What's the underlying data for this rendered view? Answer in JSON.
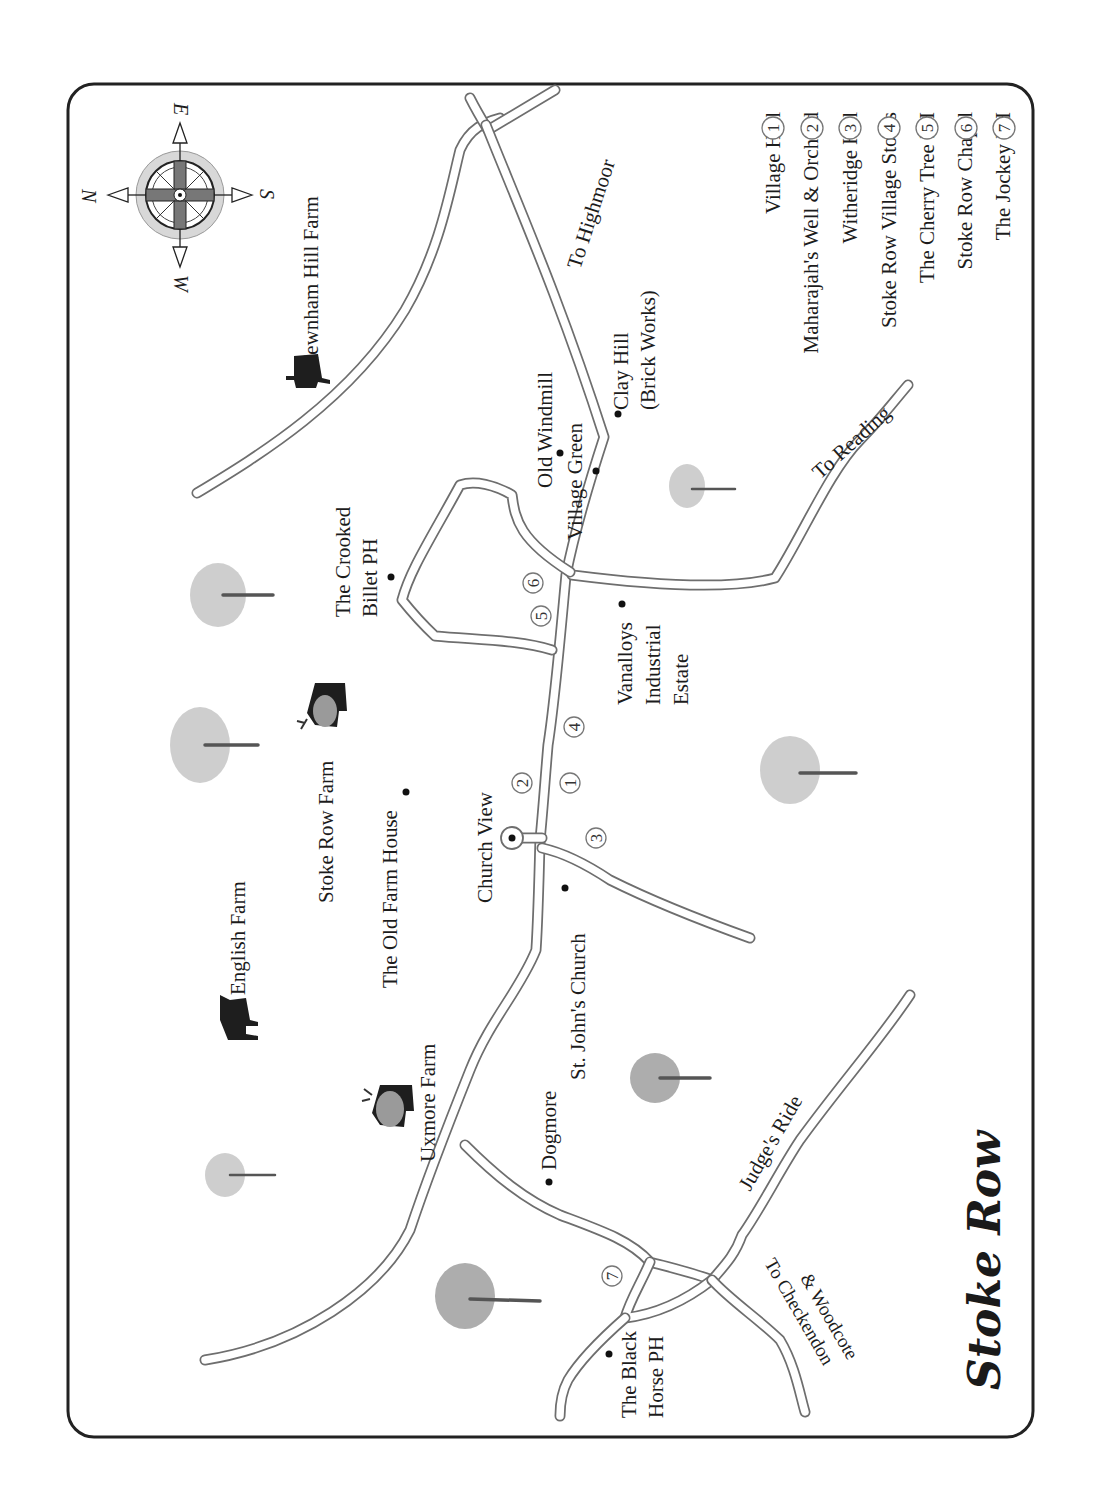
{
  "map": {
    "title": "Stoke Row",
    "orientation": "rotated 90 degrees clockwise (text reads bottom-to-top)",
    "compass": {
      "labels": {
        "north": "N",
        "east": "E",
        "south": "S",
        "west": "W"
      }
    },
    "legend": [
      {
        "number": "1",
        "label": "Village Hall"
      },
      {
        "number": "2",
        "label": "Maharajah's Well & Orchard"
      },
      {
        "number": "3",
        "label": "Witheridge Hill"
      },
      {
        "number": "4",
        "label": "Stoke Row Village Stores"
      },
      {
        "number": "5",
        "label": "The Cherry Tree PH"
      },
      {
        "number": "6",
        "label": "Stoke Row Chapel"
      },
      {
        "number": "7",
        "label": "The Jockey PH"
      }
    ],
    "places": {
      "newnham_hill_farm": "Newnham Hill Farm",
      "to_highmoor": "To Highmoor",
      "clay_hill_1": "Clay Hill",
      "clay_hill_2": "(Brick Works)",
      "old_windmill": "Old Windmill",
      "village_green": "Village Green",
      "to_reading": "To Reading",
      "crooked_billet_1": "The Crooked",
      "crooked_billet_2": "Billet PH",
      "vanalloys_1": "Vanalloys",
      "vanalloys_2": "Industrial",
      "vanalloys_3": "Estate",
      "stoke_row_farm": "Stoke Row Farm",
      "old_farm_house": "The Old Farm House",
      "church_view": "Church View",
      "st_johns_church": "St. John's Church",
      "english_farm": "English Farm",
      "uxmore_farm": "Uxmore Farm",
      "dogmore": "Dogmore",
      "judges_ride": "Judge's Ride",
      "black_horse_1": "The Black",
      "black_horse_2": "Horse PH",
      "to_checkendon_1": "To Checkendon",
      "to_checkendon_2": "& Woodcote"
    },
    "map_markers": [
      {
        "number": "1"
      },
      {
        "number": "2"
      },
      {
        "number": "3"
      },
      {
        "number": "4"
      },
      {
        "number": "5"
      },
      {
        "number": "6"
      },
      {
        "number": "7"
      }
    ]
  }
}
